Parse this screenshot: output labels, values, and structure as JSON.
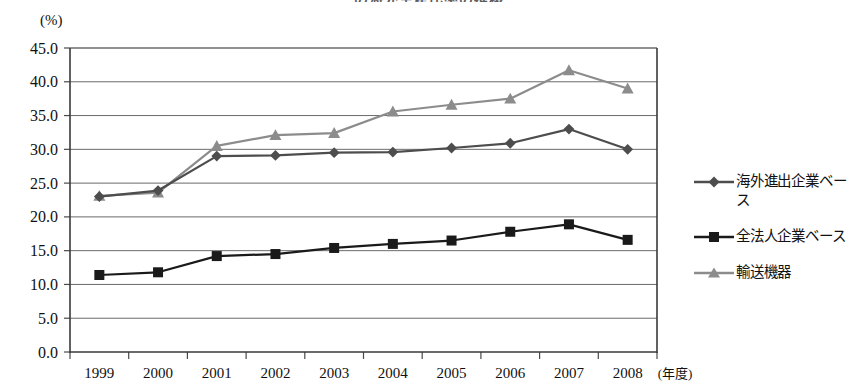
{
  "title": "の海外生産比率の推移",
  "axis_unit_label": "(%)",
  "xaxis_unit_label": "(年度)",
  "legend": {
    "items": [
      {
        "label": "海外進出企業ベース",
        "marker": "diamond-marker",
        "color": "#4d4d4d"
      },
      {
        "label": "全法人企業ベース",
        "marker": "square-marker",
        "color": "#1a1a1a"
      },
      {
        "label": "輸送機器",
        "marker": "triangle-marker",
        "color": "#8c8c8c"
      }
    ]
  },
  "chart_data": {
    "type": "line",
    "title": "の海外生産比率の推移",
    "xlabel": "(年度)",
    "ylabel": "(%)",
    "ylim": [
      0.0,
      45.0
    ],
    "ytick_step": 5.0,
    "ytick_labels": [
      "0.0",
      "5.0",
      "10.0",
      "15.0",
      "20.0",
      "25.0",
      "30.0",
      "35.0",
      "40.0",
      "45.0"
    ],
    "grid": true,
    "legend_position": "right",
    "categories": [
      "1999",
      "2000",
      "2001",
      "2002",
      "2003",
      "2004",
      "2005",
      "2006",
      "2007",
      "2008"
    ],
    "series": [
      {
        "name": "海外進出企業ベース",
        "marker": "diamond",
        "color": "#4d4d4d",
        "values": [
          23.0,
          23.9,
          29.0,
          29.1,
          29.5,
          29.6,
          30.2,
          30.9,
          33.0,
          30.0
        ]
      },
      {
        "name": "全法人企業ベース",
        "marker": "square",
        "color": "#1a1a1a",
        "values": [
          11.4,
          11.8,
          14.2,
          14.5,
          15.4,
          16.0,
          16.5,
          17.8,
          18.9,
          16.6
        ]
      },
      {
        "name": "輸送機器",
        "marker": "triangle",
        "color": "#8c8c8c",
        "values": [
          23.1,
          23.6,
          30.5,
          32.1,
          32.4,
          35.6,
          36.6,
          37.5,
          41.7,
          39.0
        ]
      }
    ]
  }
}
